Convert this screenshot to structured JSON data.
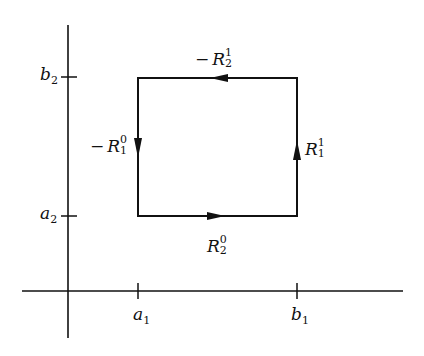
{
  "diagram": {
    "type": "rectangle-boundary-path",
    "axes": {
      "x_ticks": [
        {
          "name": "a1",
          "base": "a",
          "sub": "1"
        },
        {
          "name": "b1",
          "base": "b",
          "sub": "1"
        }
      ],
      "y_ticks": [
        {
          "name": "a2",
          "base": "a",
          "sub": "2"
        },
        {
          "name": "b2",
          "base": "b",
          "sub": "2"
        }
      ]
    },
    "edges": {
      "bottom": {
        "sign": "",
        "base": "R",
        "sup": "0",
        "sub": "2",
        "direction": "right"
      },
      "right": {
        "sign": "",
        "base": "R",
        "sup": "1",
        "sub": "1",
        "direction": "up"
      },
      "top": {
        "sign": "−",
        "base": "R",
        "sup": "1",
        "sub": "2",
        "direction": "left"
      },
      "left": {
        "sign": "−",
        "base": "R",
        "sup": "0",
        "sub": "1",
        "direction": "down"
      }
    },
    "colors": {
      "ink": "#111111",
      "background": "#ffffff"
    }
  }
}
